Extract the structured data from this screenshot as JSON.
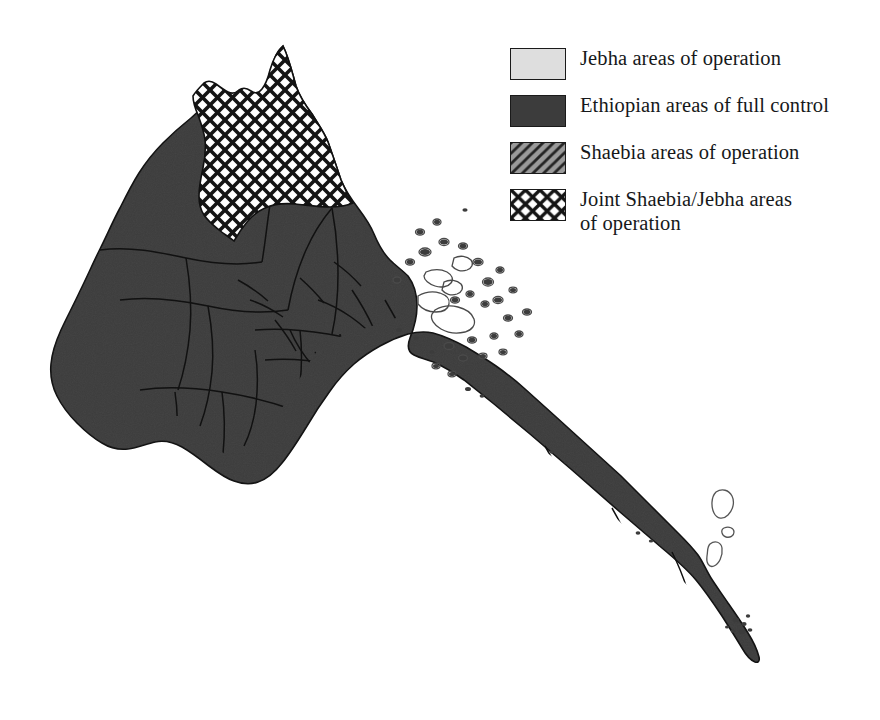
{
  "figure": {
    "kind": "thematic-map",
    "background_color": "#ffffff"
  },
  "map": {
    "land_fill_color": "#3c3c3c",
    "border_color": "#111111",
    "joint_area_fill": "#ffffff",
    "joint_area_pattern": "crosshatch",
    "island_outline_color": "#4a4a4a",
    "regions": [
      {
        "name": "northern-joint-operations-zone",
        "pattern": "crosshatch",
        "label": "Joint Shaebia/Jebha areas of operation"
      },
      {
        "name": "remainder-of-territory",
        "pattern": "solid-dark",
        "label": "Ethiopian areas of full control"
      }
    ],
    "features": [
      {
        "name": "dahlak-archipelago",
        "type": "island-group"
      },
      {
        "name": "southeastern-offshore-islands",
        "type": "island-group"
      },
      {
        "name": "red-sea-coastline",
        "type": "coastline"
      }
    ]
  },
  "legend": {
    "name": "map-legend",
    "items": [
      {
        "swatch": "light-gray-fill",
        "label": "Jebha areas of operation"
      },
      {
        "swatch": "dark-gray-fill",
        "label": "Ethiopian areas of full control"
      },
      {
        "swatch": "diagonal-hatch-fill",
        "label": "Shaebia areas of operation"
      },
      {
        "swatch": "crosshatch-fill",
        "label": "Joint Shaebia/Jebha areas\nof operation"
      }
    ],
    "colors": {
      "light": "#dedede",
      "dark": "#3c3c3c",
      "hatch_base": "#8f8f8f",
      "hatch_line": "#2a2a2a",
      "cross_line": "#111111",
      "text": "#16181a",
      "swatch_border": "#1a1a1a"
    }
  }
}
